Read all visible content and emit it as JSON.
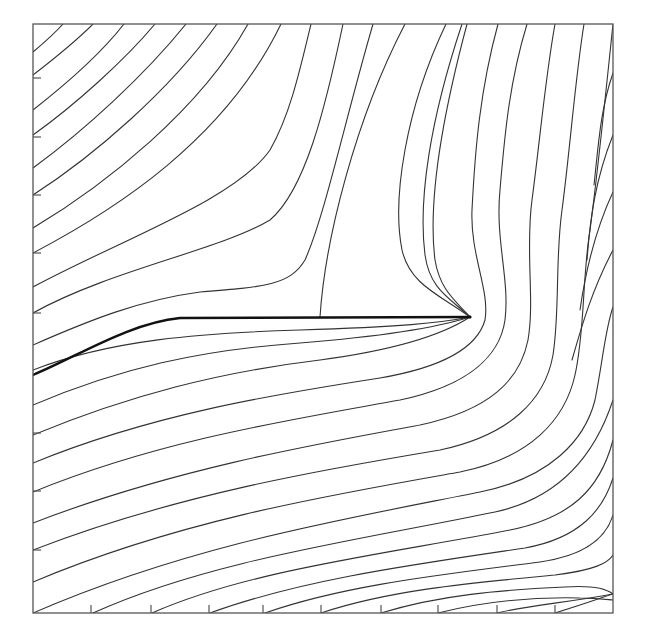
{
  "figure": {
    "type": "streamline-plot",
    "frame": {
      "x0": 33,
      "y0": 24,
      "x1": 613,
      "y1": 613
    },
    "colors": {
      "line": "#333333",
      "frame": "#555555",
      "divider": "#111111",
      "background": "#ffffff"
    },
    "ticks": {
      "bottom_x": [
        91,
        151,
        209,
        263,
        321,
        381,
        438,
        497,
        555
      ],
      "left_y": [
        78,
        137,
        195,
        253,
        313,
        433,
        491,
        550
      ],
      "tick_length": 8
    },
    "stagnation_point": {
      "x": 470,
      "y": 317
    },
    "divider_path": "M33,375 C80,355 130,323 180,318 L470,317",
    "streamlines": [
      "M33,52 C45,42 55,33 63,24",
      "M33,75 C55,58 75,42 93,24",
      "M33,110 C65,85 100,55 124,24",
      "M33,135 C75,105 125,60 155,24",
      "M33,168 C85,130 145,75 186,24",
      "M33,195 C95,155 170,90 217,24",
      "M33,228 C105,185 200,110 248,24",
      "M33,253 C115,210 225,140 281,24",
      "M33,287 C120,240 235,200 270,150 C290,115 300,70 311,24",
      "M33,313 C110,270 220,250 270,220 C305,190 325,110 343,24",
      "M33,345 C90,320 140,300 200,292 C265,287 290,285 305,260 C325,215 345,120 373,24",
      "M320,317 C325,240 355,120 405,24",
      "M33,370 C110,340 200,333 300,330 C400,327 440,323 470,317",
      "M33,405 C120,368 200,350 300,343 C400,335 445,325 470,317",
      "M33,435 C130,395 220,372 320,360 C410,348 450,330 470,317",
      "M470,317 C440,295 410,285 402,250 C392,200 405,110 446,24",
      "M470,317 C450,298 430,290 425,255 C418,200 430,120 462,24",
      "M470,317 C455,300 440,290 435,260 C428,205 440,125 467,24",
      "M33,463 C150,415 270,395 380,378 C450,366 478,345 485,320 C490,290 470,255 472,210 C475,150 480,90 498,24",
      "M33,492 C160,440 290,420 400,400 C470,385 500,355 505,320 C510,280 495,240 500,190 C505,130 510,80 527,24",
      "M33,523 C170,470 310,445 420,425 C490,410 520,380 528,340 C535,300 525,250 532,200 C540,140 545,80 555,24",
      "M33,550 C175,495 320,470 440,450 C510,435 545,400 553,355 C560,310 555,260 562,210 C570,150 575,80 584,24",
      "M33,582 C180,520 330,495 460,472 C530,458 565,420 575,375 C585,330 582,280 590,230 C598,170 605,100 613,24",
      "M33,613 C190,545 340,520 480,492 C550,478 585,440 595,400 C603,360 605,330 613,307",
      "M93,613 C210,560 360,540 495,512 C560,498 595,455 613,400 M613,400 C613,400 613,400 613,400",
      "M152,613 C250,570 380,555 510,530 C570,518 600,490 613,440",
      "M210,613 C300,580 410,565 525,548 C580,538 603,510 613,478",
      "M265,613 C345,585 440,575 540,562 C590,555 607,535 613,515",
      "M321,613 C390,590 470,583 555,575 C595,570 608,563 613,555",
      "M381,613 C440,595 500,590 565,587 C595,585 608,590 613,594",
      "M438,613 C490,600 540,597 580,598 C600,598 610,600 613,600",
      "M497,613 C530,605 565,603 613,594",
      "M555,613 C575,607 595,600 613,594",
      "M613,73 C600,110 598,150 594,185",
      "M613,135 C595,180 590,220 587,260",
      "M613,192 C593,235 585,275 580,310",
      "M613,250 C592,290 582,325 572,360"
    ],
    "labels": []
  }
}
